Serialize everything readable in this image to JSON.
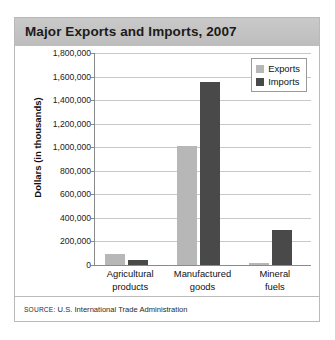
{
  "figure": {
    "title": "Major Exports and Imports, 2007",
    "source_prefix": "SOURCE:",
    "source_text": " U.S. International Trade Administration",
    "colors": {
      "header_band": "#c2c2c2",
      "exports": "#b7b7b7",
      "imports": "#494949",
      "gridline": "#c8c8c8",
      "axis": "#8a8a8a",
      "border": "#b9b9b9"
    }
  },
  "chart_data": {
    "type": "bar",
    "title": "Major Exports and Imports, 2007",
    "subtitle": "",
    "xlabel": "",
    "ylabel": "Dollars (in thousands)",
    "categories": [
      "Agricultural products",
      "Manufactured goods",
      "Mineral fuels"
    ],
    "category_lines": [
      [
        "Agricultural",
        "products"
      ],
      [
        "Manufactured",
        "goods"
      ],
      [
        "Mineral",
        "fuels"
      ]
    ],
    "series": [
      {
        "name": "Exports",
        "color": "#b7b7b7",
        "values": [
          90000,
          1010000,
          20000
        ]
      },
      {
        "name": "Imports",
        "color": "#494949",
        "values": [
          40000,
          1550000,
          295000
        ]
      }
    ],
    "ylim": [
      0,
      1800000
    ],
    "ytick_step": 200000,
    "yticks": [
      1800000,
      1600000,
      1400000,
      1200000,
      1000000,
      800000,
      600000,
      400000,
      200000,
      0
    ],
    "ytick_labels": [
      "1,800,000",
      "1,600,000",
      "1,400,000",
      "1,200,000",
      "1,000,000",
      "800,000",
      "600,000",
      "400,000",
      "200,000",
      "0"
    ],
    "grid": true,
    "legend": {
      "position": "top-right",
      "entries": [
        "Exports",
        "Imports"
      ]
    }
  }
}
